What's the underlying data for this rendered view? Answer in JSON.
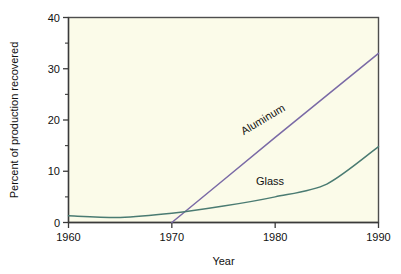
{
  "chart_data": {
    "type": "line",
    "title": "",
    "xlabel": "Year",
    "ylabel": "Percent of production recovered",
    "xlim": [
      1960,
      1990
    ],
    "ylim": [
      0,
      40
    ],
    "grid": false,
    "legend_position": "inline-labels",
    "plot_background": "#fbfbe9",
    "frame_color": "#4d4d4d",
    "x_ticks": [
      1960,
      1970,
      1980,
      1990
    ],
    "x_tick_labels": [
      "1960",
      "1970",
      "1980",
      "1990"
    ],
    "y_ticks": [
      0,
      10,
      20,
      30,
      40
    ],
    "y_tick_labels": [
      "0",
      "10",
      "20",
      "30",
      "40"
    ],
    "y_minor_ticks": [
      5,
      15,
      25,
      35
    ],
    "series": [
      {
        "name": "Aluminum",
        "color": "#7a6aa6",
        "label_rotated": true,
        "x": [
          1970,
          1975,
          1980,
          1985,
          1990
        ],
        "values": [
          0,
          8.3,
          16.6,
          24.8,
          33.0
        ]
      },
      {
        "name": "Glass",
        "color": "#4a7b72",
        "label_rotated": false,
        "x": [
          1960,
          1965,
          1970,
          1975,
          1980,
          1985,
          1990
        ],
        "values": [
          1.3,
          1.0,
          1.8,
          3.2,
          5.0,
          7.5,
          14.8
        ]
      }
    ],
    "annotations": [
      {
        "text": "Aluminum",
        "x": 1979.0,
        "y": 19.5,
        "rotation": -31
      },
      {
        "text": "Glass",
        "x": 1979.5,
        "y": 7.4,
        "rotation": 0
      }
    ]
  }
}
